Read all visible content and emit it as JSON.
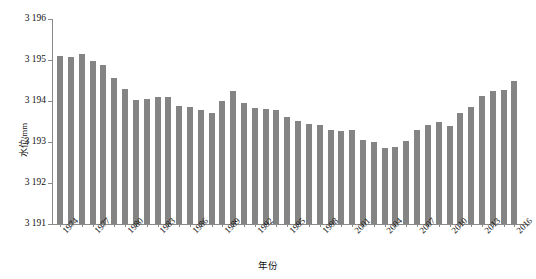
{
  "chart_data": {
    "type": "bar",
    "title": "",
    "xlabel": "年份",
    "ylabel": "水位/mm",
    "ylim": [
      3191,
      3196
    ],
    "ytick_labels": [
      "3 196",
      "3 195",
      "3 194",
      "3 193",
      "3 192",
      "3 191"
    ],
    "yticks": [
      3196,
      3195,
      3194,
      3193,
      3192,
      3191
    ],
    "grid": false,
    "legend": null,
    "bar_color": "#848484",
    "axis_color": "#8a8a8a",
    "xtick_labels": [
      "1974",
      "1977",
      "1980",
      "1983",
      "1986",
      "1989",
      "1992",
      "1995",
      "1998",
      "2001",
      "2004",
      "2007",
      "2010",
      "2013",
      "2016"
    ],
    "categories": [
      "1974",
      "1975",
      "1976",
      "1977",
      "1978",
      "1979",
      "1980",
      "1981",
      "1982",
      "1983",
      "1984",
      "1985",
      "1986",
      "1987",
      "1988",
      "1989",
      "1990",
      "1991",
      "1992",
      "1993",
      "1994",
      "1995",
      "1996",
      "1997",
      "1998",
      "1999",
      "2000",
      "2001",
      "2002",
      "2003",
      "2004",
      "2005",
      "2006",
      "2007",
      "2008",
      "2009",
      "2010",
      "2011",
      "2012",
      "2013",
      "2014",
      "2015",
      "2016"
    ],
    "values": [
      3195.1,
      3195.08,
      3195.15,
      3194.97,
      3194.87,
      3194.55,
      3194.3,
      3194.03,
      3194.04,
      3194.09,
      3194.1,
      3193.88,
      3193.85,
      3193.78,
      3193.7,
      3194.0,
      3194.25,
      3193.95,
      3193.82,
      3193.8,
      3193.78,
      3193.6,
      3193.52,
      3193.45,
      3193.42,
      3193.3,
      3193.28,
      3193.3,
      3193.05,
      3193.0,
      3192.85,
      3192.88,
      3193.02,
      3193.3,
      3193.42,
      3193.48,
      3193.4,
      3193.7,
      3193.85,
      3194.12,
      3194.25,
      3194.28,
      3194.5
    ]
  }
}
